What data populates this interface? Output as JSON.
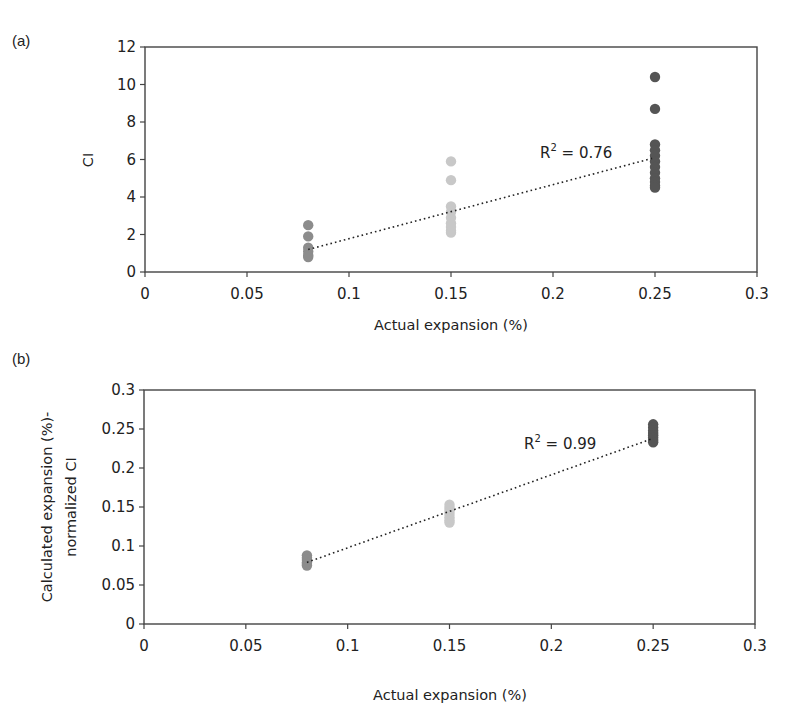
{
  "chart_data": [
    {
      "panel": "(a)",
      "type": "scatter",
      "xlabel": "Actual expansion (%)",
      "ylabel": "CI",
      "xlim": [
        0,
        0.3
      ],
      "ylim": [
        0,
        12
      ],
      "xticks": [
        "0",
        "0.05",
        "0.1",
        "0.15",
        "0.2",
        "0.25",
        "0.3"
      ],
      "yticks": [
        "0",
        "2",
        "4",
        "6",
        "8",
        "10",
        "12"
      ],
      "grid": false,
      "series": [
        {
          "name": "0.08",
          "color": "#8c8c8c",
          "x": 0.08,
          "values": [
            2.5,
            1.9,
            1.3,
            1.1,
            0.9,
            0.8
          ]
        },
        {
          "name": "0.15",
          "color": "#c8c8c8",
          "x": 0.15,
          "values": [
            5.9,
            4.9,
            3.5,
            3.2,
            2.9,
            2.6,
            2.4,
            2.2,
            2.1
          ]
        },
        {
          "name": "0.25",
          "color": "#555555",
          "x": 0.25,
          "values": [
            10.4,
            8.7,
            6.8,
            6.5,
            6.2,
            5.9,
            5.6,
            5.3,
            5.0,
            4.8,
            4.6,
            4.5
          ]
        }
      ],
      "trendline": {
        "type": "linear",
        "style": "dotted",
        "x": [
          0.08,
          0.25
        ],
        "y": [
          1.2,
          6.1
        ]
      },
      "annotation": "R² = 0.76"
    },
    {
      "panel": "(b)",
      "type": "scatter",
      "xlabel": "Actual expansion (%)",
      "ylabel": "Calculated expansion (%)-normalized CI",
      "ylabel_lines": [
        "Calculated expansion (%)-",
        "normalized CI"
      ],
      "xlim": [
        0,
        0.3
      ],
      "ylim": [
        0,
        0.3
      ],
      "xticks": [
        "0",
        "0.05",
        "0.1",
        "0.15",
        "0.2",
        "0.25",
        "0.3"
      ],
      "yticks": [
        "0",
        "0.05",
        "0.1",
        "0.15",
        "0.2",
        "0.25",
        "0.3"
      ],
      "grid": false,
      "series": [
        {
          "name": "0.08",
          "color": "#8c8c8c",
          "x": 0.08,
          "values": [
            0.088,
            0.085,
            0.082,
            0.079,
            0.077,
            0.075
          ]
        },
        {
          "name": "0.15",
          "color": "#c8c8c8",
          "x": 0.15,
          "values": [
            0.153,
            0.149,
            0.145,
            0.141,
            0.137,
            0.133,
            0.13
          ]
        },
        {
          "name": "0.25",
          "color": "#555555",
          "x": 0.25,
          "values": [
            0.256,
            0.252,
            0.248,
            0.245,
            0.242,
            0.239,
            0.236,
            0.233
          ]
        }
      ],
      "trendline": {
        "type": "linear",
        "style": "dotted",
        "x": [
          0.08,
          0.25
        ],
        "y": [
          0.079,
          0.238
        ]
      },
      "annotation": "R² = 0.99"
    }
  ],
  "labels": {
    "panel_a": "(a)",
    "panel_b": "(b)",
    "a_ylabel": "CI",
    "a_xlabel": "Actual expansion (%)",
    "a_r2": "R",
    "a_r2_sup": "2",
    "a_r2_val": " = 0.76",
    "b_ylabel_1": "Calculated expansion (%)-",
    "b_ylabel_2": "normalized CI",
    "b_xlabel": "Actual expansion (%)",
    "b_r2": "R",
    "b_r2_sup": "2",
    "b_r2_val": " = 0.99"
  }
}
